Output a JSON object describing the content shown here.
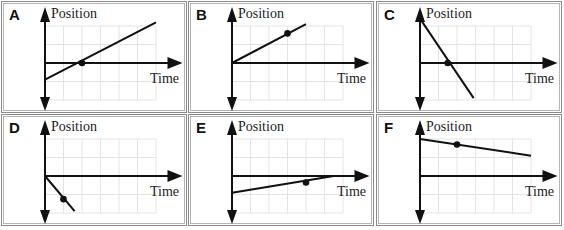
{
  "figure": {
    "axis_labels": {
      "y": "Position",
      "x": "Time"
    },
    "panels": [
      {
        "letter": "A",
        "line": {
          "x1": 0,
          "y1": -0.9,
          "x2": 6,
          "y2": 2.2
        },
        "dot": {
          "x": 2,
          "y": 0
        }
      },
      {
        "letter": "B",
        "line": {
          "x1": 0,
          "y1": 0,
          "x2": 4,
          "y2": 2.1
        },
        "dot": {
          "x": 3,
          "y": 1.6
        }
      },
      {
        "letter": "C",
        "line": {
          "x1": 0,
          "y1": 2.4,
          "x2": 2.9,
          "y2": -1.9
        },
        "dot": {
          "x": 1.5,
          "y": 0
        }
      },
      {
        "letter": "D",
        "line": {
          "x1": 0,
          "y1": 0,
          "x2": 1.6,
          "y2": -1.9
        },
        "dot": {
          "x": 1,
          "y": -1.25
        }
      },
      {
        "letter": "E",
        "line": {
          "x1": 0,
          "y1": -0.9,
          "x2": 5.5,
          "y2": 0
        },
        "dot": {
          "x": 4,
          "y": -0.35
        }
      },
      {
        "letter": "F",
        "line": {
          "x1": 0,
          "y1": 2,
          "x2": 6,
          "y2": 1.1
        },
        "dot": {
          "x": 2,
          "y": 1.7
        }
      }
    ]
  }
}
